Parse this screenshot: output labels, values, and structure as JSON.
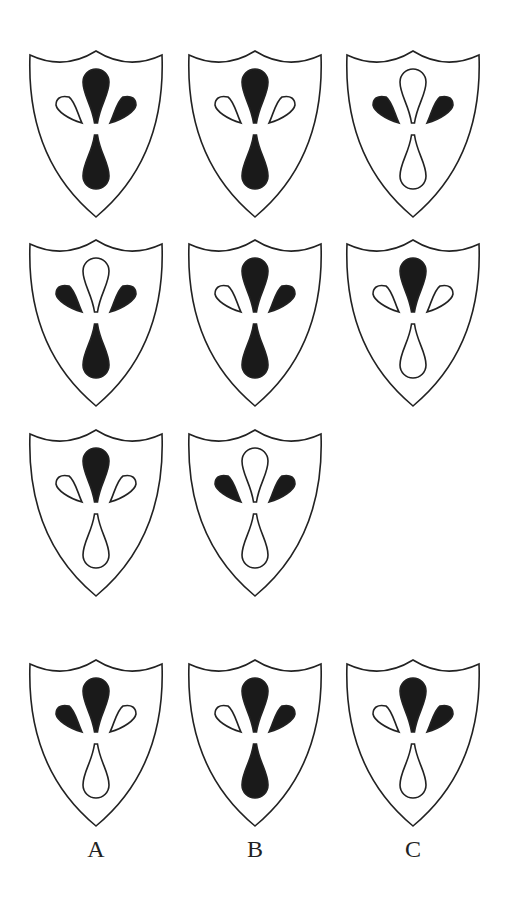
{
  "puzzle": {
    "type": "shield-pattern-matrix",
    "colors": {
      "filled": "#1a1a1a",
      "empty": "#ffffff",
      "stroke": "#222222"
    },
    "grid": [
      {
        "id": "r1c1",
        "top": "black",
        "left": "white",
        "right": "black",
        "bottom": "black"
      },
      {
        "id": "r1c2",
        "top": "black",
        "left": "white",
        "right": "white",
        "bottom": "black"
      },
      {
        "id": "r1c3",
        "top": "white",
        "left": "black",
        "right": "black",
        "bottom": "white"
      },
      {
        "id": "r2c1",
        "top": "white",
        "left": "black",
        "right": "black",
        "bottom": "black"
      },
      {
        "id": "r2c2",
        "top": "black",
        "left": "white",
        "right": "black",
        "bottom": "black"
      },
      {
        "id": "r2c3",
        "top": "black",
        "left": "white",
        "right": "white",
        "bottom": "white"
      },
      {
        "id": "r3c1",
        "top": "black",
        "left": "white",
        "right": "white",
        "bottom": "white"
      },
      {
        "id": "r3c2",
        "top": "white",
        "left": "black",
        "right": "black",
        "bottom": "white"
      }
    ],
    "options": [
      {
        "label": "A",
        "top": "black",
        "left": "black",
        "right": "white",
        "bottom": "white"
      },
      {
        "label": "B",
        "top": "black",
        "left": "white",
        "right": "black",
        "bottom": "black"
      },
      {
        "label": "C",
        "top": "black",
        "left": "white",
        "right": "black",
        "bottom": "white"
      }
    ]
  }
}
